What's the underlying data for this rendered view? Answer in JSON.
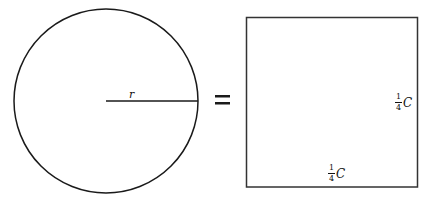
{
  "diagram": {
    "circle": {
      "radius_label": "r",
      "center": [
        106,
        101
      ],
      "radius": 92
    },
    "operator": "=",
    "square": {
      "side_label_right": {
        "numerator": "1",
        "denominator": "4",
        "variable": "C"
      },
      "side_label_bottom": {
        "numerator": "1",
        "denominator": "4",
        "variable": "C"
      },
      "x": 246,
      "y": 17,
      "width": 172,
      "height": 170
    },
    "colors": {
      "stroke": "#1a1a1a",
      "background": "#ffffff"
    }
  }
}
